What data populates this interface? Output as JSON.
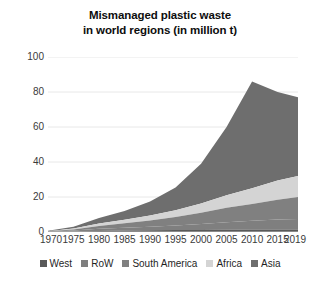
{
  "chart_data": {
    "type": "area",
    "stacked": true,
    "title": "Mismanaged plastic waste in world regions (in million t)",
    "title_lines": [
      "Mismanaged plastic waste",
      "in world regions (in million t)"
    ],
    "xlabel": "",
    "ylabel": "",
    "ylim": [
      0,
      100
    ],
    "yticks": [
      0,
      20,
      40,
      60,
      80,
      100
    ],
    "xlim": [
      1970,
      2019
    ],
    "xticks": [
      1970,
      1975,
      1980,
      1985,
      1990,
      1995,
      2000,
      2005,
      2010,
      2015,
      2019
    ],
    "xtick_labels": [
      "1970",
      "1975",
      "1980",
      "1985",
      "1990",
      "1995",
      "2000",
      "2005",
      "2010",
      "2015",
      "2019"
    ],
    "grid": "horizontal",
    "legend_position": "bottom",
    "x": [
      1970,
      1975,
      1980,
      1985,
      1990,
      1995,
      2000,
      2005,
      2010,
      2015,
      2019
    ],
    "series": [
      {
        "name": "West",
        "color": "#595959",
        "values": [
          0.1,
          0.3,
          0.6,
          0.8,
          1.0,
          1.1,
          1.2,
          1.3,
          1.4,
          1.5,
          1.5
        ]
      },
      {
        "name": "RoW",
        "color": "#7f7f7f",
        "values": [
          0.1,
          0.5,
          1.2,
          1.6,
          2.0,
          2.6,
          3.4,
          4.3,
          5.1,
          5.7,
          6.0
        ]
      },
      {
        "name": "South America",
        "color": "#808080",
        "values": [
          0.2,
          0.7,
          1.7,
          2.6,
          3.6,
          4.9,
          6.4,
          8.2,
          9.5,
          11.2,
          12.5
        ]
      },
      {
        "name": "Africa",
        "color": "#d4d4d4",
        "values": [
          0.1,
          0.5,
          1.3,
          2.0,
          2.8,
          3.9,
          5.3,
          7.2,
          9.0,
          11.0,
          12.0
        ]
      },
      {
        "name": "Asia",
        "color": "#6e6e6e",
        "values": [
          0.2,
          1.0,
          3.2,
          5.0,
          8.1,
          13.0,
          22.7,
          39.0,
          61.0,
          50.6,
          45.0
        ]
      }
    ],
    "totals": [
      0.7,
      3.0,
      8.0,
      12.0,
      17.5,
      25.5,
      39.0,
      60.0,
      86.0,
      80.0,
      77.0
    ]
  },
  "legend": {
    "items": [
      {
        "label": "West",
        "color": "#595959"
      },
      {
        "label": "RoW",
        "color": "#7f7f7f"
      },
      {
        "label": "South America",
        "color": "#808080"
      },
      {
        "label": "Africa",
        "color": "#d4d4d4"
      },
      {
        "label": "Asia",
        "color": "#6e6e6e"
      }
    ]
  },
  "colors": {
    "background": "#ffffff",
    "gridline": "#e8e8e8",
    "axis_text": "#3a3a3a",
    "title_text": "#0d0d0d"
  }
}
